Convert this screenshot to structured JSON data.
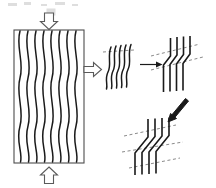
{
  "figure": {
    "background_color": "#ffffff",
    "line_color": "#1a1a1a",
    "dashed_guide_color": "#8a8a8a",
    "box_stroke_color": "#4d4d4d",
    "arrow_outline_color": "#5a5a5a",
    "width_px": 216,
    "height_px": 188
  },
  "specimen": {
    "label": "specimen-block",
    "x": 14,
    "y": 30,
    "width": 70,
    "height": 133,
    "fiber_count": 8,
    "fiber_state": "wavy"
  },
  "load_arrows": [
    {
      "name": "top-compression-arrow",
      "direction": "down",
      "style": "hollow-outline",
      "x": 49,
      "y": 13
    },
    {
      "name": "bottom-compression-arrow",
      "direction": "up",
      "style": "hollow-outline",
      "x": 49,
      "y": 175
    }
  ],
  "callout_arrow": {
    "name": "magnify-callout-arrow",
    "direction": "right",
    "style": "hollow-outline",
    "x": 90,
    "y": 64
  },
  "stages": [
    {
      "id": "stage-1",
      "name": "wavy-fibers-cluster",
      "description": "Initially wavy fibers",
      "fiber_count": 5,
      "fiber_state": "wavy",
      "dashed_guides": 1
    },
    {
      "id": "stage-2",
      "name": "kink-band-narrow-cluster",
      "description": "Narrow kink band forms",
      "fiber_count": 4,
      "fiber_state": "kinked",
      "dashed_guides": 2
    },
    {
      "id": "stage-3",
      "name": "kink-band-broadened-cluster",
      "description": "Kink band broadens",
      "fiber_count": 4,
      "fiber_state": "kinked-broad",
      "dashed_guides": 3
    }
  ],
  "transition_arrows": [
    {
      "name": "stage1-to-stage2-arrow",
      "direction": "right",
      "style": "solid-thin"
    },
    {
      "name": "stage2-to-stage3-arrow",
      "direction": "down-left",
      "style": "solid-thick"
    }
  ]
}
